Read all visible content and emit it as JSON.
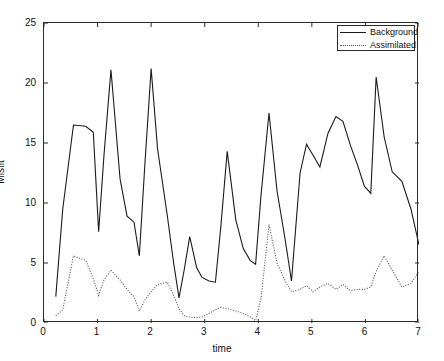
{
  "chart_data": {
    "type": "line",
    "title": "",
    "xlabel": "time",
    "ylabel": "Misfit",
    "xlim": [
      0,
      7
    ],
    "ylim": [
      0,
      25
    ],
    "xticks": [
      0,
      1,
      2,
      3,
      4,
      5,
      6,
      7
    ],
    "yticks": [
      0,
      5,
      10,
      15,
      20,
      25
    ],
    "grid": false,
    "legend_position": "top-right",
    "legend": [
      "Background",
      "Assimilated"
    ],
    "x": [
      0.22,
      0.35,
      0.55,
      0.78,
      0.92,
      1.02,
      1.12,
      1.25,
      1.42,
      1.55,
      1.68,
      1.78,
      1.88,
      2.0,
      2.12,
      2.3,
      2.42,
      2.52,
      2.62,
      2.72,
      2.85,
      2.95,
      3.08,
      3.2,
      3.3,
      3.42,
      3.58,
      3.72,
      3.85,
      3.95,
      4.05,
      4.2,
      4.35,
      4.5,
      4.62,
      4.78,
      4.9,
      5.02,
      5.15,
      5.3,
      5.45,
      5.58,
      5.72,
      5.85,
      5.98,
      6.1,
      6.2,
      6.35,
      6.5,
      6.68,
      6.85,
      7.0
    ],
    "series": [
      {
        "name": "Background",
        "style": "solid",
        "color": "#1a1a1a",
        "values": [
          2.2,
          9.5,
          16.5,
          16.4,
          15.9,
          7.6,
          14.0,
          21.1,
          12.0,
          8.9,
          8.4,
          5.6,
          13.0,
          21.2,
          14.5,
          9.0,
          5.0,
          2.1,
          4.5,
          7.2,
          4.6,
          3.8,
          3.5,
          3.4,
          8.0,
          14.3,
          8.6,
          6.2,
          5.2,
          4.9,
          10.6,
          17.5,
          11.0,
          7.0,
          3.5,
          12.5,
          14.9,
          14.0,
          13.0,
          15.8,
          17.2,
          16.8,
          14.8,
          13.2,
          11.4,
          10.8,
          20.5,
          15.5,
          12.6,
          11.8,
          9.5,
          6.5
        ]
      },
      {
        "name": "Assimilated",
        "style": "dotted",
        "color": "#4d4d4d",
        "values": [
          0.6,
          1.1,
          5.6,
          5.2,
          3.7,
          2.3,
          3.6,
          4.4,
          3.6,
          2.8,
          2.2,
          1.0,
          1.9,
          2.6,
          3.2,
          3.4,
          2.3,
          1.2,
          0.6,
          0.5,
          0.45,
          0.5,
          0.8,
          1.1,
          1.3,
          1.2,
          1.0,
          0.8,
          0.5,
          0.2,
          2.0,
          8.2,
          5.0,
          3.5,
          2.6,
          2.8,
          3.1,
          2.6,
          3.0,
          3.3,
          2.8,
          3.2,
          2.7,
          2.8,
          2.8,
          3.0,
          4.3,
          5.6,
          4.4,
          3.0,
          3.3,
          4.3
        ]
      }
    ]
  }
}
